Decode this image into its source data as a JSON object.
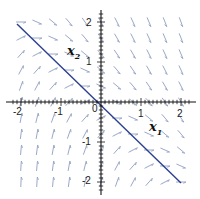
{
  "diagram": {
    "type": "phase-portrait",
    "axes": {
      "x_label": "x",
      "x_label_sub": "1",
      "y_label": "x",
      "y_label_sub": "2",
      "x_ticks": [
        "-2",
        "-1",
        "0",
        "1",
        "2"
      ],
      "y_ticks": [
        "2",
        "1",
        "-1",
        "-2"
      ],
      "range": [
        -2.3,
        2.3
      ]
    },
    "colors": {
      "field": "#9aa8c8",
      "trajectory": "#2b3f8f",
      "axis": "#111111"
    },
    "trajectory": {
      "description": "straight-line solution x2 = -x1",
      "from": [
        -2.1,
        1.95
      ],
      "to": [
        1.98,
        -2.0
      ]
    }
  }
}
